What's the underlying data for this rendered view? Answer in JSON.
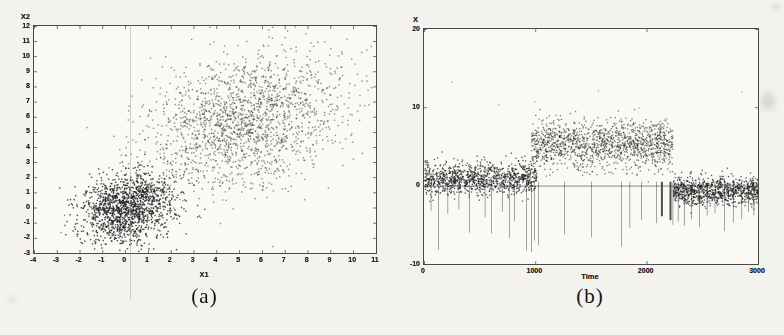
{
  "page": {
    "background": "#f3f2ee"
  },
  "captions": {
    "a": "(a)",
    "b": "(b)"
  },
  "chart_data": [
    {
      "id": "a",
      "type": "scatter",
      "title": "",
      "xlabel": "X1",
      "ylabel": "X2",
      "xlim": [
        -4,
        11
      ],
      "ylim": [
        -3,
        12
      ],
      "xticks": [
        -4,
        -3,
        -2,
        -1,
        0,
        1,
        2,
        3,
        4,
        5,
        6,
        7,
        8,
        9,
        10,
        11
      ],
      "yticks": [
        -3,
        -2,
        -1,
        0,
        1,
        2,
        3,
        4,
        5,
        6,
        7,
        8,
        9,
        10,
        11,
        12
      ],
      "grid": false,
      "legend": null,
      "point_color": "#222222",
      "point_size": 1.4,
      "seed": 1337,
      "clusters": [
        {
          "name": "dense-cluster-at-origin",
          "n": 1500,
          "mean": [
            0.1,
            0.0
          ],
          "sd": [
            1.05,
            1.15
          ],
          "corr": 0.25,
          "alpha": 0.8
        },
        {
          "name": "sparse-upper-right-cluster",
          "n": 1900,
          "mean": [
            5.2,
            5.8
          ],
          "sd": [
            2.2,
            2.3
          ],
          "corr": 0.3,
          "alpha": 0.5
        }
      ]
    },
    {
      "id": "b",
      "type": "scatter",
      "title": "",
      "xlabel": "Time",
      "ylabel": "X",
      "xlim": [
        0,
        3000
      ],
      "ylim": [
        -10,
        20
      ],
      "xticks": [
        0,
        1000,
        2000,
        3000
      ],
      "yticks": [
        -10,
        0,
        10,
        20
      ],
      "grid": false,
      "legend": null,
      "zero_line": true,
      "point_color": "#222222",
      "point_size": 1.3,
      "seed": 2024,
      "segments": [
        {
          "name": "regime-1-low",
          "t_range": [
            0,
            1010
          ],
          "mean": 1.0,
          "sd": 1.0,
          "n": 1100,
          "alpha": 0.75
        },
        {
          "name": "regime-2-elevated",
          "t_range": [
            960,
            2230
          ],
          "mean": 5.3,
          "sd": 1.55,
          "n": 1400,
          "alpha": 0.6
        },
        {
          "name": "regime-3-low",
          "t_range": [
            2235,
            3000
          ],
          "mean": -0.6,
          "sd": 0.9,
          "n": 950,
          "alpha": 0.75
        }
      ],
      "spikes": [
        {
          "t": 60,
          "v": -3.2
        },
        {
          "t": 126,
          "v": -8.2
        },
        {
          "t": 210,
          "v": -3.6
        },
        {
          "t": 310,
          "v": -3.0
        },
        {
          "t": 405,
          "v": -6.0
        },
        {
          "t": 545,
          "v": -4.0
        },
        {
          "t": 602,
          "v": -6.1
        },
        {
          "t": 700,
          "v": -3.3
        },
        {
          "t": 764,
          "v": -6.7
        },
        {
          "t": 808,
          "v": -4.5
        },
        {
          "t": 917,
          "v": -8.3
        },
        {
          "t": 961,
          "v": -8.5
        },
        {
          "t": 988,
          "v": -7.0
        },
        {
          "t": 1024,
          "v": -7.6
        },
        {
          "t": 1258,
          "v": -6.2
        },
        {
          "t": 1500,
          "v": -6.6
        },
        {
          "t": 1770,
          "v": -7.8
        },
        {
          "t": 1845,
          "v": -5.4
        },
        {
          "t": 1950,
          "v": -4.4
        },
        {
          "t": 2085,
          "v": -4.8
        },
        {
          "t": 2128,
          "v": -3.9,
          "w": 2
        },
        {
          "t": 2205,
          "v": -4.4,
          "w": 2
        },
        {
          "t": 2232,
          "v": -5.0
        },
        {
          "t": 2280,
          "v": -4.6
        },
        {
          "t": 2335,
          "v": -5.1
        },
        {
          "t": 2400,
          "v": -4.3
        },
        {
          "t": 2470,
          "v": -5.3
        },
        {
          "t": 2540,
          "v": -3.8
        },
        {
          "t": 2610,
          "v": -3.5
        },
        {
          "t": 2695,
          "v": -5.8
        },
        {
          "t": 2775,
          "v": -4.7
        },
        {
          "t": 2850,
          "v": -4.3
        },
        {
          "t": 2910,
          "v": -3.4
        },
        {
          "t": 2960,
          "v": -3.8
        }
      ],
      "outliers": [
        {
          "t": 243,
          "v": 13.3
        },
        {
          "t": 665,
          "v": 10.4
        },
        {
          "t": 988,
          "v": 10.8
        },
        {
          "t": 1560,
          "v": 12.2
        },
        {
          "t": 1923,
          "v": 10.0
        },
        {
          "t": 2848,
          "v": 12.0
        }
      ]
    }
  ]
}
